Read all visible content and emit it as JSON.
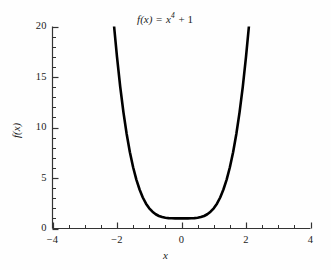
{
  "chart_data": {
    "type": "line",
    "title_parts": {
      "fn": "f(x)",
      "equals": " = ",
      "base": "x",
      "exponent": "4",
      "tail": " + 1"
    },
    "xlabel": "x",
    "ylabel": "f(x)",
    "xlim": [
      -4,
      4
    ],
    "ylim": [
      0,
      20
    ],
    "grid": false,
    "legend": null,
    "x_ticks": [
      -4,
      -2,
      0,
      2,
      4
    ],
    "x_tick_labels": [
      "-4",
      "-2",
      "0",
      "2",
      "4"
    ],
    "x_minor_tick_step": 0.5,
    "y_ticks": [
      0,
      5,
      10,
      15,
      20
    ],
    "y_tick_labels": [
      "0",
      "5",
      "10",
      "15",
      "20"
    ],
    "y_minor_tick_step": 1,
    "series": [
      {
        "name": "f(x) = x^4 + 1",
        "color": "#000000",
        "linewidth": 2.6,
        "x": [
          -2.09,
          -2.0,
          -1.9,
          -1.8,
          -1.7,
          -1.6,
          -1.5,
          -1.4,
          -1.3,
          -1.2,
          -1.1,
          -1.0,
          -0.9,
          -0.8,
          -0.7,
          -0.6,
          -0.5,
          -0.4,
          -0.3,
          -0.2,
          -0.1,
          0.0,
          0.1,
          0.2,
          0.3,
          0.4,
          0.5,
          0.6,
          0.7,
          0.8,
          0.9,
          1.0,
          1.1,
          1.2,
          1.3,
          1.4,
          1.5,
          1.6,
          1.7,
          1.8,
          1.9,
          2.0,
          2.09
        ],
        "y": [
          20.0,
          17.0,
          14.03,
          11.5,
          9.35,
          7.55,
          6.06,
          4.84,
          3.86,
          3.07,
          2.46,
          2.0,
          1.66,
          1.41,
          1.24,
          1.13,
          1.06,
          1.03,
          1.01,
          1.0,
          1.0,
          1.0,
          1.0,
          1.0,
          1.01,
          1.03,
          1.06,
          1.13,
          1.24,
          1.41,
          1.66,
          2.0,
          2.46,
          3.07,
          3.86,
          4.84,
          6.06,
          7.55,
          9.35,
          11.5,
          14.03,
          17.0,
          20.0
        ]
      }
    ]
  },
  "axes": {
    "left_spine_visible": true,
    "bottom_spine_visible": true,
    "top_spine_visible": false,
    "right_spine_visible": false,
    "tick_direction": "in",
    "axis_color": "#333333"
  }
}
